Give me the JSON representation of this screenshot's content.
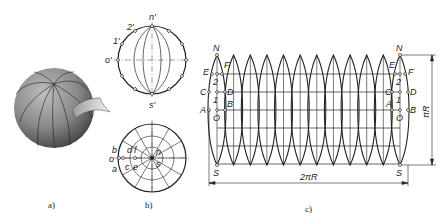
{
  "figure": {
    "panels": [
      {
        "id": "a",
        "caption": "a)",
        "description": "Shaded sphere with meridian gore lines, one gore peeled back"
      },
      {
        "id": "b",
        "caption": "b)",
        "description": "Front and top projections of sphere divided into gores"
      },
      {
        "id": "c",
        "caption": "c)",
        "description": "Approximate development of sphere as 12 lens-shaped gores"
      }
    ],
    "panel_b": {
      "front_view_labels": {
        "top": "n'",
        "bottom": "s'",
        "left": "o'",
        "p1": "1'",
        "p2": "2'"
      },
      "top_view_labels": {
        "b": "b",
        "o": "o",
        "a": "a",
        "d": "d",
        "f": "f",
        "c": "c",
        "e": "e",
        "n": "n",
        "s": "s"
      }
    },
    "panel_c": {
      "gore_count": 12,
      "left_gore_labels": {
        "N": "N",
        "E": "E",
        "F": "F",
        "two": "2",
        "C": "C",
        "D": "D",
        "one": "1",
        "A": "A",
        "B": "B",
        "O": "O",
        "S": "S"
      },
      "right_gore_labels": {
        "N": "N",
        "E": "E",
        "F": "F",
        "two": "2",
        "C": "C",
        "D": "D",
        "one": "1",
        "A": "A",
        "B": "B",
        "O": "O",
        "S": "S"
      },
      "width_dimension": "2πR",
      "height_dimension": "πR"
    }
  }
}
